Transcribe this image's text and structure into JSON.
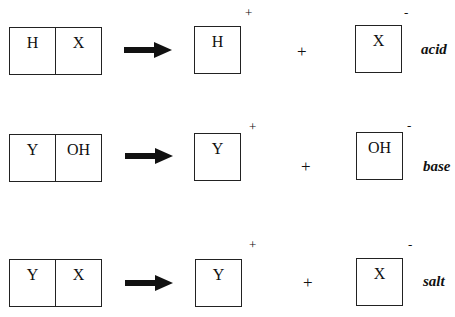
{
  "reactions": [
    {
      "name": "acid",
      "reactant": [
        "H",
        "X"
      ],
      "cation": {
        "symbol": "H",
        "charge": "+"
      },
      "plus": "+",
      "anion": {
        "symbol": "X",
        "charge": "-"
      },
      "label": "acid"
    },
    {
      "name": "base",
      "reactant": [
        "Y",
        "OH"
      ],
      "cation": {
        "symbol": "Y",
        "charge": "+"
      },
      "plus": "+",
      "anion": {
        "symbol": "OH",
        "charge": "-"
      },
      "label": "base"
    },
    {
      "name": "salt",
      "reactant": [
        "Y",
        "X"
      ],
      "cation": {
        "symbol": "Y",
        "charge": "+"
      },
      "plus": "+",
      "anion": {
        "symbol": "X",
        "charge": "-"
      },
      "label": "salt"
    }
  ],
  "icons": {
    "arrow": "right-arrow-icon"
  },
  "colors": {
    "ink": "#111111",
    "background": "#ffffff"
  }
}
